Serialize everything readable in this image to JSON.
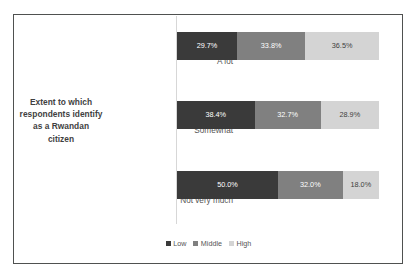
{
  "figure": {
    "background_color": "#ffffff",
    "border_color": "#4f5150"
  },
  "axis_title": {
    "line1": "Extent to which",
    "line2": "respondents identify",
    "line3": "as a Rwandan",
    "line4": "citizen",
    "full_text": "Extent to which respondents identify as a Rwandan citizen"
  },
  "legend": {
    "position": "bottom-center",
    "items": [
      {
        "label": "Low",
        "color": "#3a3a3a",
        "swatch": "square-swatch-icon"
      },
      {
        "label": "Middle",
        "color": "#808080",
        "swatch": "square-swatch-icon"
      },
      {
        "label": "High",
        "color": "#d4d4d4",
        "swatch": "square-swatch-icon"
      }
    ]
  },
  "rows": [
    {
      "category": "A lot",
      "segments": [
        {
          "series": "Low",
          "label": "29.7%",
          "value": 29.7
        },
        {
          "series": "Middle",
          "label": "33.8%",
          "value": 33.8
        },
        {
          "series": "High",
          "label": "36.5%",
          "value": 36.5
        }
      ]
    },
    {
      "category": "Somewhat",
      "segments": [
        {
          "series": "Low",
          "label": "38.4%",
          "value": 38.4
        },
        {
          "series": "Middle",
          "label": "32.7%",
          "value": 32.7
        },
        {
          "series": "High",
          "label": "28.9%",
          "value": 28.9
        }
      ]
    },
    {
      "category": "Not very much",
      "segments": [
        {
          "series": "Low",
          "label": "50.0%",
          "value": 50.0
        },
        {
          "series": "Middle",
          "label": "32.0%",
          "value": 32.0
        },
        {
          "series": "High",
          "label": "18.0%",
          "value": 18.0
        }
      ]
    }
  ],
  "chart_data": {
    "type": "bar",
    "orientation": "horizontal",
    "stacked": true,
    "normalized_percent": true,
    "title": "",
    "subtitle": "",
    "xlabel": "",
    "ylabel": "Extent to which respondents identify as a Rwandan citizen",
    "categories": [
      "A lot",
      "Somewhat",
      "Not very much"
    ],
    "series": [
      {
        "name": "Low",
        "color": "#3a3a3a",
        "values": [
          29.7,
          33.8,
          50.0
        ]
      },
      {
        "name": "Middle",
        "color": "#808080",
        "values": [
          33.8,
          32.7,
          32.0
        ]
      },
      {
        "name": "High",
        "color": "#d4d4d4",
        "values": [
          36.5,
          28.9,
          18.0
        ]
      }
    ],
    "series_by_category": {
      "A lot": {
        "Low": 29.7,
        "Middle": 33.8,
        "High": 36.5
      },
      "Somewhat": {
        "Low": 38.4,
        "Middle": 32.7,
        "High": 28.9
      },
      "Not very much": {
        "Low": 50.0,
        "Middle": 32.0,
        "High": 18.0
      }
    },
    "data_labels": [
      [
        "29.7%",
        "33.8%",
        "36.5%"
      ],
      [
        "38.4%",
        "32.7%",
        "28.9%"
      ],
      [
        "50.0%",
        "32.0%",
        "18.0%"
      ]
    ],
    "xlim": [
      0,
      100
    ],
    "xticks": [],
    "yticks": [
      "A lot",
      "Somewhat",
      "Not very much"
    ],
    "grid": false,
    "legend": {
      "entries": [
        "Low",
        "Middle",
        "High"
      ],
      "position": "bottom-center"
    },
    "annotations": []
  }
}
